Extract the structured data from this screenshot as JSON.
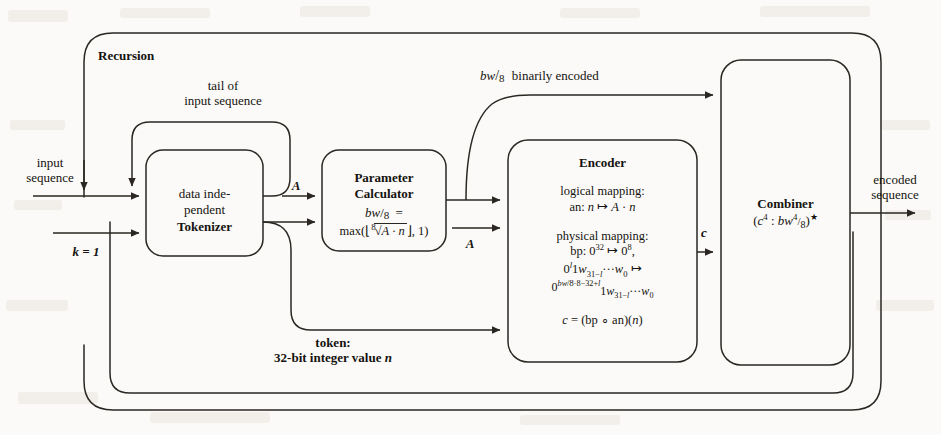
{
  "diagram": {
    "title": "Recursion",
    "outer_label": "Recursion",
    "external": {
      "input_label_line1": "input",
      "input_label_line2": "sequence",
      "k_label": "k = 1",
      "output_label_line1": "encoded",
      "output_label_line2": "sequence"
    },
    "edges": {
      "tail_line1": "tail of",
      "tail_line2": "input sequence",
      "bw_binary": "binarily encoded",
      "bw_binary_prefix_num": "bw",
      "bw_binary_prefix_den": "8",
      "A_label_top": "A",
      "A_label_enc": "A",
      "c_label": "c",
      "token_line1": "token:",
      "token_line2": "32-bit integer value n"
    },
    "blocks": [
      {
        "id": "tokenizer",
        "name": "Tokenizer",
        "lines": [
          "data inde-",
          "pendent",
          "Tokenizer"
        ]
      },
      {
        "id": "parameter-calculator",
        "name": "Parameter Calculator",
        "lines": [
          "Parameter",
          "Calculator"
        ],
        "formula_lhs_num": "bw",
        "formula_lhs_den": "8",
        "formula_eq": "=",
        "formula_rhs": "max( ⌊",
        "formula_root_index": "8",
        "formula_root_body": "A · n",
        "formula_tail": "⌋ , 1 )"
      },
      {
        "id": "encoder",
        "name": "Encoder",
        "title": "Encoder",
        "logical_header": "logical mapping:",
        "logical_body_prefix": "an: ",
        "logical_body": "n ↦ A · n",
        "physical_header": "physical mapping:",
        "physical_line1_prefix": "bp: 0",
        "physical_line1_sup1": "32",
        "physical_line1_mid": " ↦ 0",
        "physical_line1_sup2": "8",
        "physical_line1_suffix": ",",
        "physical_line2": "0ℓ 1w31−ℓ ··· w0 ↦",
        "physical_line3": "0 bw/8 ·8−32+ℓ 1w31−ℓ ··· w0",
        "result": "c = (bp ∘ an)(n)"
      },
      {
        "id": "combiner",
        "name": "Combiner",
        "title": "Combiner",
        "formula_open": "(",
        "formula_c": "c",
        "formula_c_sup": "4",
        "formula_colon": " : ",
        "formula_bw": "bw",
        "formula_bw_sup": "4",
        "formula_bw_sub": "8",
        "formula_close": ")",
        "formula_star": "★"
      }
    ],
    "colors": {
      "ink": "#15130f",
      "paper": "#fbfaf8",
      "line": "#2a2722"
    }
  }
}
